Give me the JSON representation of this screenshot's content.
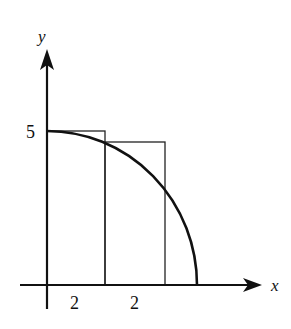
{
  "diagram": {
    "axes": {
      "x_label": "x",
      "y_label": "y"
    },
    "y_tick_label": "5",
    "interval_labels": [
      "2",
      "2"
    ],
    "curve": "quarter-ellipse from (0,5) to x-intercept",
    "rectangles": [
      {
        "x_start": 0,
        "x_end": 2,
        "height": 5
      },
      {
        "x_start": 2,
        "x_end": 4,
        "height": "f(2)"
      }
    ]
  }
}
